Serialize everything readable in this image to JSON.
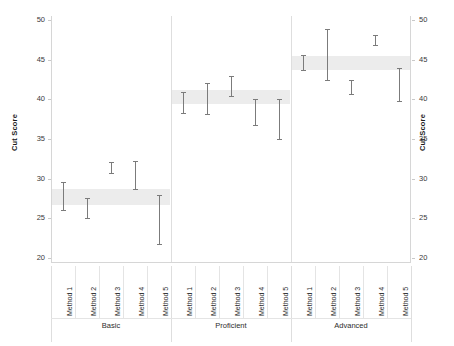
{
  "chart_data": {
    "type": "scatter",
    "title": "",
    "xlabel": "",
    "ylabel": "Cut Score",
    "ylabel_right": "Cut Score",
    "ylim": [
      20,
      50
    ],
    "yticks": [
      20,
      25,
      30,
      35,
      40,
      45,
      50
    ],
    "grid": false,
    "legend": "none",
    "categories": [
      "Method 1",
      "Method 2",
      "Method 3",
      "Method 4",
      "Method 5"
    ],
    "groups": [
      {
        "name": "Basic",
        "band": {
          "low": 26.7,
          "high": 28.7
        },
        "series": [
          {
            "name": "Method 1",
            "low": 26.1,
            "high": 29.6
          },
          {
            "name": "Method 2",
            "low": 25.0,
            "high": 27.6
          },
          {
            "name": "Method 3",
            "low": 30.7,
            "high": 32.1
          },
          {
            "name": "Method 4",
            "low": 28.7,
            "high": 32.2
          },
          {
            "name": "Method 5",
            "low": 21.8,
            "high": 28.0
          }
        ]
      },
      {
        "name": "Proficient",
        "band": {
          "low": 39.4,
          "high": 41.2
        },
        "series": [
          {
            "name": "Method 1",
            "low": 38.3,
            "high": 40.9
          },
          {
            "name": "Method 2",
            "low": 38.2,
            "high": 42.0
          },
          {
            "name": "Method 3",
            "low": 40.4,
            "high": 43.0
          },
          {
            "name": "Method 4",
            "low": 36.8,
            "high": 40.1
          },
          {
            "name": "Method 5",
            "low": 35.0,
            "high": 40.0
          }
        ]
      },
      {
        "name": "Advanced",
        "band": {
          "low": 43.7,
          "high": 45.5
        },
        "series": [
          {
            "name": "Method 1",
            "low": 43.7,
            "high": 45.6
          },
          {
            "name": "Method 2",
            "low": 42.4,
            "high": 48.9
          },
          {
            "name": "Method 3",
            "low": 40.7,
            "high": 42.5
          },
          {
            "name": "Method 4",
            "low": 46.9,
            "high": 48.1
          },
          {
            "name": "Method 5",
            "low": 39.8,
            "high": 44.0
          }
        ]
      }
    ]
  },
  "colors": {
    "band": "#ececec",
    "errorbar": "#7b7b7b",
    "axis": "#d6d6d6",
    "text": "#2c2c2c",
    "background": "#ffffff"
  }
}
